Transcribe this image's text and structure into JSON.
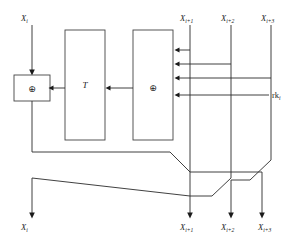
{
  "diagram": {
    "type": "block-cipher-round-diagram",
    "background_color": "#ffffff",
    "line_color": "#2b2b2b",
    "box_stroke_color": "#444444",
    "inputs_top": [
      {
        "id": "in-x-i",
        "base": "X",
        "sub": "i",
        "x": 25,
        "y": 18
      },
      {
        "id": "in-x-i1",
        "base": "X",
        "sub": "i+1",
        "x": 185,
        "y": 18
      },
      {
        "id": "in-x-i2",
        "base": "X",
        "sub": "i+2",
        "x": 226,
        "y": 18
      },
      {
        "id": "in-x-i3",
        "base": "X",
        "sub": "i+3",
        "x": 266,
        "y": 18
      }
    ],
    "key_input": {
      "id": "rk-i",
      "base": "rk",
      "sub": "i",
      "x": 276,
      "y": 95
    },
    "outputs_bottom": [
      {
        "id": "out-x-i",
        "base": "X",
        "sub": "i",
        "x": 25,
        "y": 226
      },
      {
        "id": "out-x-i1",
        "base": "X",
        "sub": "i+1",
        "x": 185,
        "y": 226
      },
      {
        "id": "out-x-i2",
        "base": "X",
        "sub": "i+2",
        "x": 226,
        "y": 226
      },
      {
        "id": "out-x-i3",
        "base": "X",
        "sub": "i+3",
        "x": 266,
        "y": 226
      }
    ],
    "blocks": [
      {
        "id": "xor-left",
        "label": "⊕",
        "kind": "symbol",
        "x": 14,
        "y": 75,
        "w": 36,
        "h": 26
      },
      {
        "id": "t-box",
        "label": "T",
        "kind": "text",
        "x": 65,
        "y": 30,
        "w": 40,
        "h": 110
      },
      {
        "id": "xor-right",
        "label": "⊕",
        "kind": "symbol",
        "x": 133,
        "y": 30,
        "w": 40,
        "h": 110
      }
    ],
    "xor_symbol": "⊕",
    "t_label": "T",
    "notes": {
      "xor_left_name": "left-xor-block",
      "xor_right_name": "right-xor-block",
      "transform_name": "t-transform-block"
    }
  }
}
